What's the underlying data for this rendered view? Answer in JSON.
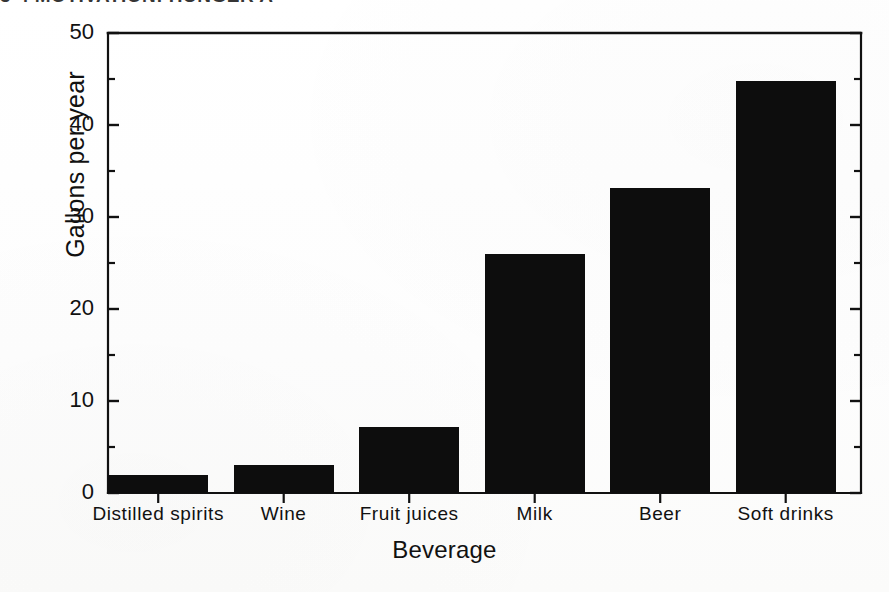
{
  "page": {
    "top_fragment": "3-4  MOTIVATION: HUNGER A"
  },
  "chart_data": {
    "type": "bar",
    "title": "",
    "subtitle": "",
    "categories": [
      "Distilled  spirits",
      "Wine",
      "Fruit  juices",
      "Milk",
      "Beer",
      "Soft  drinks"
    ],
    "values": [
      2.0,
      3.0,
      7.2,
      26.0,
      33.2,
      44.8
    ],
    "xlabel": "Beverage",
    "ylabel": "Gallons per year",
    "ylim": [
      0,
      50
    ],
    "ytick_labels": [
      "0",
      "10",
      "20",
      "30",
      "40",
      "50"
    ],
    "ytick_values": [
      0,
      10,
      20,
      30,
      40,
      50
    ],
    "yminor_values": [
      5,
      15,
      25,
      35,
      45
    ],
    "grid": false,
    "legend": false,
    "bar_color": "#0d0d0d",
    "axis_color": "#111111"
  }
}
